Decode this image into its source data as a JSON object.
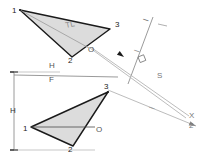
{
  "figure": {
    "background": "#ffffff",
    "ink_dark": "#1a1a1a",
    "ink_mid": "#6f6f6f",
    "ink_light": "#b9b9b9",
    "fill_gray": "#dcdcdc"
  },
  "upper_view": {
    "name": "top-view-triangle",
    "vertices": [
      {
        "label": "1",
        "x": 20,
        "y": 10,
        "lx": 12,
        "ly": 13
      },
      {
        "label": "3",
        "x": 110,
        "y": 29,
        "lx": 115,
        "ly": 27
      },
      {
        "label": "2",
        "x": 72,
        "y": 57,
        "lx": 68,
        "ly": 63
      }
    ],
    "interior_label": {
      "text": "TL",
      "x": 66,
      "y": 28,
      "rotation": -12
    },
    "point_o": {
      "label": "O",
      "x": 89,
      "y": 48,
      "lx": 88,
      "ly": 52
    }
  },
  "lower_view": {
    "name": "front-view-triangle",
    "vertices": [
      {
        "label": "1",
        "x": 31,
        "y": 127,
        "lx": 23,
        "ly": 131
      },
      {
        "label": "3",
        "x": 108,
        "y": 92,
        "lx": 104,
        "ly": 89
      },
      {
        "label": "2",
        "x": 73,
        "y": 146,
        "lx": 68,
        "ly": 152
      }
    ],
    "point_o": {
      "label": "O",
      "x": 95,
      "y": 127,
      "lx": 96,
      "ly": 132
    }
  },
  "fold_line": {
    "name": "h-f-fold-line",
    "label_top": "H",
    "label_bottom": "F",
    "x1": 14,
    "y1": 75,
    "x2": 118,
    "y2": 77,
    "label_top_x": 49,
    "label_top_y": 68,
    "label_bottom_x": 49,
    "label_bottom_y": 82
  },
  "dimension": {
    "name": "height-dimension",
    "label": "H",
    "x": 14,
    "label_x": 10,
    "label_y": 113,
    "y_top": 72,
    "y_bottom": 150
  },
  "auxiliary_axis": {
    "name": "auxiliary-fold-line-1-s",
    "label_upper": "I",
    "label_lower": "S",
    "x1": 153,
    "y1": 17,
    "x2": 128,
    "y2": 84,
    "label_upper_x": 148,
    "label_upper_y": 22,
    "label_lower_x": 157,
    "label_lower_y": 78,
    "tick_x1": 158,
    "tick_y1": 24,
    "tick_x2": 167,
    "tick_y2": 26
  },
  "sight_line": {
    "name": "line-of-sight-arrow",
    "x1": 90,
    "y1": 48,
    "x2": 186,
    "y2": 118,
    "arrow_x": 124,
    "arrow_y": 57,
    "label": "I",
    "label_x": 139,
    "label_y": 53
  },
  "projection_band": {
    "name": "projection-band-to-point-view",
    "line_a": {
      "x1": 108,
      "y1": 90,
      "x2": 196,
      "y2": 126
    },
    "line_b": {
      "x1": 92,
      "y1": 48,
      "x2": 189,
      "y2": 116
    },
    "mid_label": "I",
    "mid_label_x": 154,
    "mid_label_y": 110
  },
  "end_labels": {
    "name": "point-view-labels",
    "primary": "X",
    "secondary": "2",
    "primary_x": 189,
    "primary_y": 118,
    "secondary_x": 189,
    "secondary_y": 128
  },
  "right_angle_marker": {
    "name": "right-angle-symbol",
    "x": 138,
    "y": 57,
    "size": 6
  }
}
